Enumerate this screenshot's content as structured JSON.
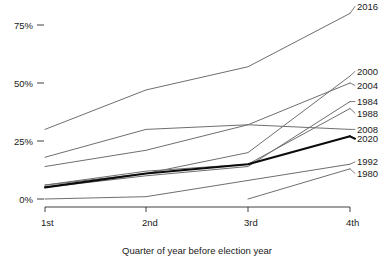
{
  "chart_data": {
    "type": "line",
    "title": "",
    "subtitle": "",
    "xlabel": "Quarter of year before election year",
    "ylabel": "",
    "categories": [
      "1st",
      "2nd",
      "3rd",
      "4th"
    ],
    "x_tick_labels": [
      "1st",
      "2nd",
      "3rd",
      "4th"
    ],
    "y_tick_labels": [
      "0%",
      "25%",
      "50%",
      "75%"
    ],
    "y_tick_values": [
      0,
      25,
      50,
      75
    ],
    "ylim": [
      0,
      85
    ],
    "xlim": [
      1,
      4
    ],
    "grid": false,
    "legend": "right-of-plot-line-labels",
    "series": [
      {
        "name": "2016",
        "label": "2016",
        "color": "#6e6e6e",
        "width": 1.0,
        "emphasis": false,
        "values": [
          30,
          47,
          57,
          80
        ]
      },
      {
        "name": "2000",
        "label": "2000",
        "color": "#6e6e6e",
        "width": 1.0,
        "emphasis": false,
        "values": [
          6,
          11,
          20,
          53
        ]
      },
      {
        "name": "2004",
        "label": "2004",
        "color": "#6e6e6e",
        "width": 1.0,
        "emphasis": false,
        "values": [
          14,
          21,
          32,
          50
        ]
      },
      {
        "name": "1984",
        "label": "1984",
        "color": "#6e6e6e",
        "width": 1.0,
        "emphasis": false,
        "values": [
          5,
          10,
          14,
          42
        ]
      },
      {
        "name": "1988",
        "label": "1988",
        "color": "#6e6e6e",
        "width": 1.0,
        "emphasis": false,
        "values": [
          6,
          12,
          15,
          39
        ]
      },
      {
        "name": "2008",
        "label": "2008",
        "color": "#6e6e6e",
        "width": 1.0,
        "emphasis": false,
        "values": [
          18,
          30,
          32,
          30
        ]
      },
      {
        "name": "2020",
        "label": "2020",
        "color": "#0b0b0b",
        "width": 2.1,
        "emphasis": true,
        "values": [
          5,
          11,
          15,
          27
        ]
      },
      {
        "name": "1992",
        "label": "1992",
        "color": "#6e6e6e",
        "width": 1.0,
        "emphasis": false,
        "values": [
          0,
          1,
          8,
          15
        ]
      },
      {
        "name": "1980",
        "label": "1980",
        "color": "#6e6e6e",
        "width": 1.0,
        "emphasis": false,
        "values": [
          null,
          null,
          0,
          13
        ]
      }
    ],
    "label_positions": [
      {
        "name": "2016",
        "y_pct": 83
      },
      {
        "name": "2000",
        "y_pct": 55
      },
      {
        "name": "2004",
        "y_pct": 49
      },
      {
        "name": "1984",
        "y_pct": 42
      },
      {
        "name": "1988",
        "y_pct": 37
      },
      {
        "name": "2008",
        "y_pct": 30
      },
      {
        "name": "2020",
        "y_pct": 26
      },
      {
        "name": "1992",
        "y_pct": 16
      },
      {
        "name": "1980",
        "y_pct": 11
      }
    ],
    "colors": {
      "axis": "#2b2b2b",
      "text": "#1a1a1a",
      "series_default": "#6e6e6e",
      "series_highlight": "#0b0b0b",
      "background": "#ffffff"
    }
  }
}
